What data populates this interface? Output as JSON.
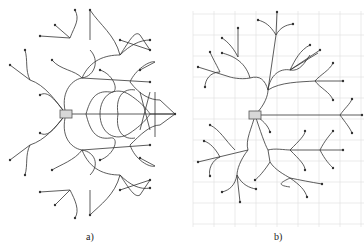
{
  "figure": {
    "panels": [
      {
        "id": "a",
        "label": "a)",
        "description": "Dense tree of curved motion-primitive paths expanding from a root node, with overlapping branches"
      },
      {
        "id": "b",
        "label": "b)",
        "description": "Sparser tree of curved paths expanding from a root node on a uniform grid"
      }
    ],
    "colors": {
      "edge": "#333333",
      "grid": "#e2e2e2",
      "root_fill": "#d8d8d8"
    }
  }
}
